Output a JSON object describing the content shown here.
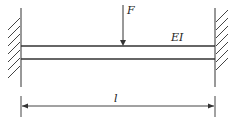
{
  "diagram": {
    "type": "fixed-fixed beam with point load",
    "labels": {
      "force": "F",
      "stiffness": "EI",
      "length": "l"
    },
    "colors": {
      "line": "#333333",
      "background": "#ffffff"
    }
  }
}
